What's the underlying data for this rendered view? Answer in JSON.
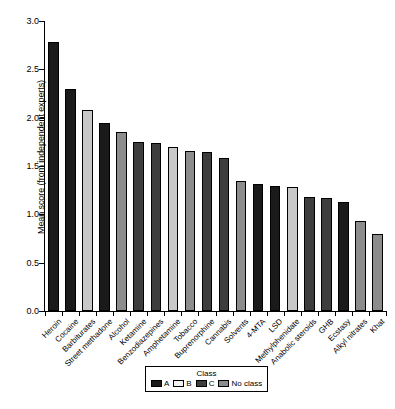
{
  "chart_data": {
    "type": "bar",
    "title": "",
    "subtitle": "",
    "xlabel": "",
    "ylabel": "Mean score (from independent experts)",
    "ylim": [
      0.0,
      3.0
    ],
    "yticks": [
      "0.0",
      "0.5",
      "1.0",
      "1.5",
      "2.0",
      "2.5",
      "3.0"
    ],
    "ytick_values": [
      0.0,
      0.5,
      1.0,
      1.5,
      2.0,
      2.5,
      3.0
    ],
    "grid": false,
    "legend_position": "bottom-center",
    "categories": [
      "Heroin",
      "Cocaine",
      "Barbiturates",
      "Street methadone",
      "Alcohol",
      "Ketamine",
      "Benzodiazepines",
      "Amphetamine",
      "Tobacco",
      "Buprenorphine",
      "Cannabis",
      "Solvents",
      "4-MTA",
      "LSD",
      "Methylphenidate",
      "Anabolic steroids",
      "GHB",
      "Ecstasy",
      "Alkyl nitrates",
      "Khat"
    ],
    "values": [
      2.78,
      2.3,
      2.08,
      1.94,
      1.85,
      1.75,
      1.74,
      1.7,
      1.66,
      1.64,
      1.58,
      1.34,
      1.31,
      1.29,
      1.28,
      1.18,
      1.17,
      1.13,
      0.93,
      0.8
    ],
    "classes": [
      "A",
      "A",
      "B",
      "A",
      "No class",
      "C",
      "C",
      "B",
      "No class",
      "C",
      "C",
      "No class",
      "A",
      "A",
      "B",
      "C",
      "C",
      "A",
      "No class",
      "No class"
    ]
  },
  "legend": {
    "title": "Class",
    "items": [
      {
        "label": "A",
        "color": "#1a1a1a"
      },
      {
        "label": "B",
        "color": "#f2f2f2"
      },
      {
        "label": "C",
        "color": "#3d3d3d"
      },
      {
        "label": "No class",
        "color": "#8c8c8c"
      }
    ]
  },
  "class_colors": {
    "A": "#1a1a1a",
    "B": "#c8c8c8",
    "C": "#3d3d3d",
    "No class": "#8c8c8c"
  }
}
